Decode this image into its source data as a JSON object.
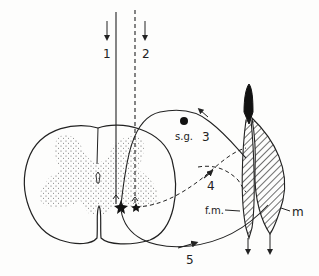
{
  "figure": {
    "type": "anatomical schematic",
    "colors": {
      "ink": "#222222",
      "background": "#fdfdfc",
      "stipple": "#555555"
    }
  },
  "labels": {
    "path1": "1",
    "path2": "2",
    "path3": "3",
    "path4": "4",
    "path5": "5",
    "spinal_ganglion": "s.g.",
    "fusimotor_muscle": "f.m.",
    "muscle": "m"
  },
  "pathways": [
    {
      "id": "1",
      "style": "solid",
      "description": "descending tract line"
    },
    {
      "id": "2",
      "style": "dashed",
      "description": "descending tract line"
    },
    {
      "id": "3",
      "style": "solid",
      "description": "afferent fibre through spinal ganglion"
    },
    {
      "id": "4",
      "style": "dashed",
      "description": "fibre to f.m."
    },
    {
      "id": "5",
      "style": "solid",
      "description": "motor fibre to m"
    }
  ]
}
